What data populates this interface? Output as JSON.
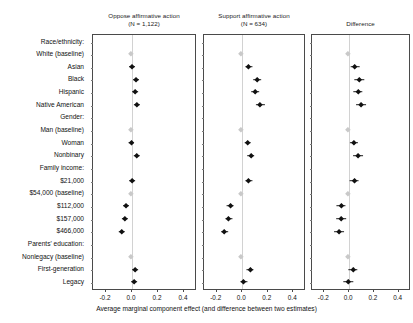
{
  "figure": {
    "xaxis_title": "Average marginal component effect (and difference between two estimates)",
    "x_tick_labels": [
      "-0.2",
      "0.0",
      "0.2",
      "0.4"
    ],
    "x_tick_values": [
      -0.2,
      0.0,
      0.2,
      0.4
    ],
    "baseline_color": "#c9c9c9",
    "estimate_color": "#111111",
    "panel_border_color": "#4a4a4a"
  },
  "panels": [
    {
      "title_line1": "Oppose affirmative action",
      "title_line2": "(N = 1,122)"
    },
    {
      "title_line1": "Support affirmative action",
      "title_line2": "(N = 634)"
    },
    {
      "title_line1": "Difference",
      "title_line2": ""
    }
  ],
  "rows": [
    {
      "label": "Race/ethnicity:",
      "type": "header"
    },
    {
      "label": "White (baseline)",
      "type": "baseline"
    },
    {
      "label": "Asian",
      "type": "item"
    },
    {
      "label": "Black",
      "type": "item"
    },
    {
      "label": "Hispanic",
      "type": "item"
    },
    {
      "label": "Native American",
      "type": "item"
    },
    {
      "label": "Gender:",
      "type": "header"
    },
    {
      "label": "Man (baseline)",
      "type": "baseline"
    },
    {
      "label": "Woman",
      "type": "item"
    },
    {
      "label": "Nonbinary",
      "type": "item"
    },
    {
      "label": "Family income:",
      "type": "header"
    },
    {
      "label": "$21,000",
      "type": "item"
    },
    {
      "label": "$54,000 (baseline)",
      "type": "baseline"
    },
    {
      "label": "$112,000",
      "type": "item"
    },
    {
      "label": "$157,000",
      "type": "item"
    },
    {
      "label": "$466,000",
      "type": "item"
    },
    {
      "label": "Parents' education:",
      "type": "header"
    },
    {
      "label": "Nonlegacy (baseline)",
      "type": "baseline"
    },
    {
      "label": "First-generation",
      "type": "item"
    },
    {
      "label": "Legacy",
      "type": "item"
    }
  ],
  "chart_data": {
    "type": "scatter",
    "title": "",
    "xlabel": "Average marginal component effect (and difference between two estimates)",
    "ylabel": "",
    "xlim": [
      -0.3,
      0.5
    ],
    "xticks": [
      -0.2,
      0.0,
      0.2,
      0.4
    ],
    "grid": false,
    "legend": "none",
    "categories": [
      "Race/ethnicity:",
      "White (baseline)",
      "Asian",
      "Black",
      "Hispanic",
      "Native American",
      "Gender:",
      "Man (baseline)",
      "Woman",
      "Nonbinary",
      "Family income:",
      "$21,000",
      "$54,000 (baseline)",
      "$112,000",
      "$157,000",
      "$466,000",
      "Parents' education:",
      "Nonlegacy (baseline)",
      "First-generation",
      "Legacy"
    ],
    "series": [
      {
        "name": "Oppose affirmative action (N = 1,122)",
        "points": [
          null,
          {
            "estimate": 0.0,
            "low": 0.0,
            "high": 0.0,
            "baseline": true
          },
          {
            "estimate": 0.005,
            "low": -0.018,
            "high": 0.028,
            "baseline": false
          },
          {
            "estimate": 0.035,
            "low": 0.012,
            "high": 0.058,
            "baseline": false
          },
          {
            "estimate": 0.03,
            "low": 0.008,
            "high": 0.052,
            "baseline": false
          },
          {
            "estimate": 0.046,
            "low": 0.022,
            "high": 0.07,
            "baseline": false
          },
          null,
          {
            "estimate": 0.0,
            "low": 0.0,
            "high": 0.0,
            "baseline": true
          },
          {
            "estimate": 0.003,
            "low": -0.016,
            "high": 0.022,
            "baseline": false
          },
          {
            "estimate": 0.043,
            "low": 0.018,
            "high": 0.068,
            "baseline": false
          },
          null,
          {
            "estimate": 0.01,
            "low": -0.012,
            "high": 0.032,
            "baseline": false
          },
          {
            "estimate": 0.0,
            "low": 0.0,
            "high": 0.0,
            "baseline": true
          },
          {
            "estimate": -0.035,
            "low": -0.058,
            "high": -0.012,
            "baseline": false
          },
          {
            "estimate": -0.048,
            "low": -0.072,
            "high": -0.024,
            "baseline": false
          },
          {
            "estimate": -0.07,
            "low": -0.095,
            "high": -0.045,
            "baseline": false
          },
          null,
          {
            "estimate": 0.0,
            "low": 0.0,
            "high": 0.0,
            "baseline": true
          },
          {
            "estimate": 0.03,
            "low": 0.008,
            "high": 0.052,
            "baseline": false
          },
          {
            "estimate": 0.026,
            "low": 0.004,
            "high": 0.048,
            "baseline": false
          }
        ]
      },
      {
        "name": "Support affirmative action (N = 634)",
        "points": [
          null,
          {
            "estimate": 0.0,
            "low": 0.0,
            "high": 0.0,
            "baseline": true
          },
          {
            "estimate": 0.06,
            "low": 0.032,
            "high": 0.088,
            "baseline": false
          },
          {
            "estimate": 0.125,
            "low": 0.095,
            "high": 0.155,
            "baseline": false
          },
          {
            "estimate": 0.11,
            "low": 0.08,
            "high": 0.14,
            "baseline": false
          },
          {
            "estimate": 0.15,
            "low": 0.118,
            "high": 0.182,
            "baseline": false
          },
          null,
          {
            "estimate": 0.0,
            "low": 0.0,
            "high": 0.0,
            "baseline": true
          },
          {
            "estimate": 0.05,
            "low": 0.024,
            "high": 0.076,
            "baseline": false
          },
          {
            "estimate": 0.075,
            "low": 0.045,
            "high": 0.105,
            "baseline": false
          },
          null,
          {
            "estimate": 0.06,
            "low": 0.032,
            "high": 0.088,
            "baseline": false
          },
          {
            "estimate": 0.0,
            "low": 0.0,
            "high": 0.0,
            "baseline": true
          },
          {
            "estimate": -0.085,
            "low": -0.112,
            "high": -0.058,
            "baseline": false
          },
          {
            "estimate": -0.098,
            "low": -0.126,
            "high": -0.07,
            "baseline": false
          },
          {
            "estimate": -0.13,
            "low": -0.16,
            "high": -0.1,
            "baseline": false
          },
          null,
          {
            "estimate": 0.0,
            "low": 0.0,
            "high": 0.0,
            "baseline": true
          },
          {
            "estimate": 0.07,
            "low": 0.042,
            "high": 0.098,
            "baseline": false
          },
          {
            "estimate": 0.02,
            "low": -0.008,
            "high": 0.048,
            "baseline": false
          }
        ]
      },
      {
        "name": "Difference",
        "points": [
          null,
          {
            "estimate": 0.0,
            "low": 0.0,
            "high": 0.0,
            "baseline": true
          },
          {
            "estimate": 0.055,
            "low": 0.02,
            "high": 0.09,
            "baseline": false
          },
          {
            "estimate": 0.09,
            "low": 0.052,
            "high": 0.128,
            "baseline": false
          },
          {
            "estimate": 0.08,
            "low": 0.042,
            "high": 0.118,
            "baseline": false
          },
          {
            "estimate": 0.105,
            "low": 0.065,
            "high": 0.145,
            "baseline": false
          },
          null,
          {
            "estimate": 0.0,
            "low": 0.0,
            "high": 0.0,
            "baseline": true
          },
          {
            "estimate": 0.045,
            "low": 0.012,
            "high": 0.078,
            "baseline": false
          },
          {
            "estimate": 0.078,
            "low": 0.038,
            "high": 0.118,
            "baseline": false
          },
          null,
          {
            "estimate": 0.05,
            "low": 0.014,
            "high": 0.086,
            "baseline": false
          },
          {
            "estimate": 0.0,
            "low": 0.0,
            "high": 0.0,
            "baseline": true
          },
          {
            "estimate": -0.055,
            "low": -0.092,
            "high": -0.018,
            "baseline": false
          },
          {
            "estimate": -0.055,
            "low": -0.094,
            "high": -0.016,
            "baseline": false
          },
          {
            "estimate": -0.075,
            "low": -0.115,
            "high": -0.035,
            "baseline": false
          },
          null,
          {
            "estimate": 0.0,
            "low": 0.0,
            "high": 0.0,
            "baseline": true
          },
          {
            "estimate": 0.04,
            "low": 0.002,
            "high": 0.078,
            "baseline": false
          },
          {
            "estimate": 0.0,
            "low": -0.038,
            "high": 0.038,
            "baseline": false
          }
        ]
      }
    ]
  }
}
